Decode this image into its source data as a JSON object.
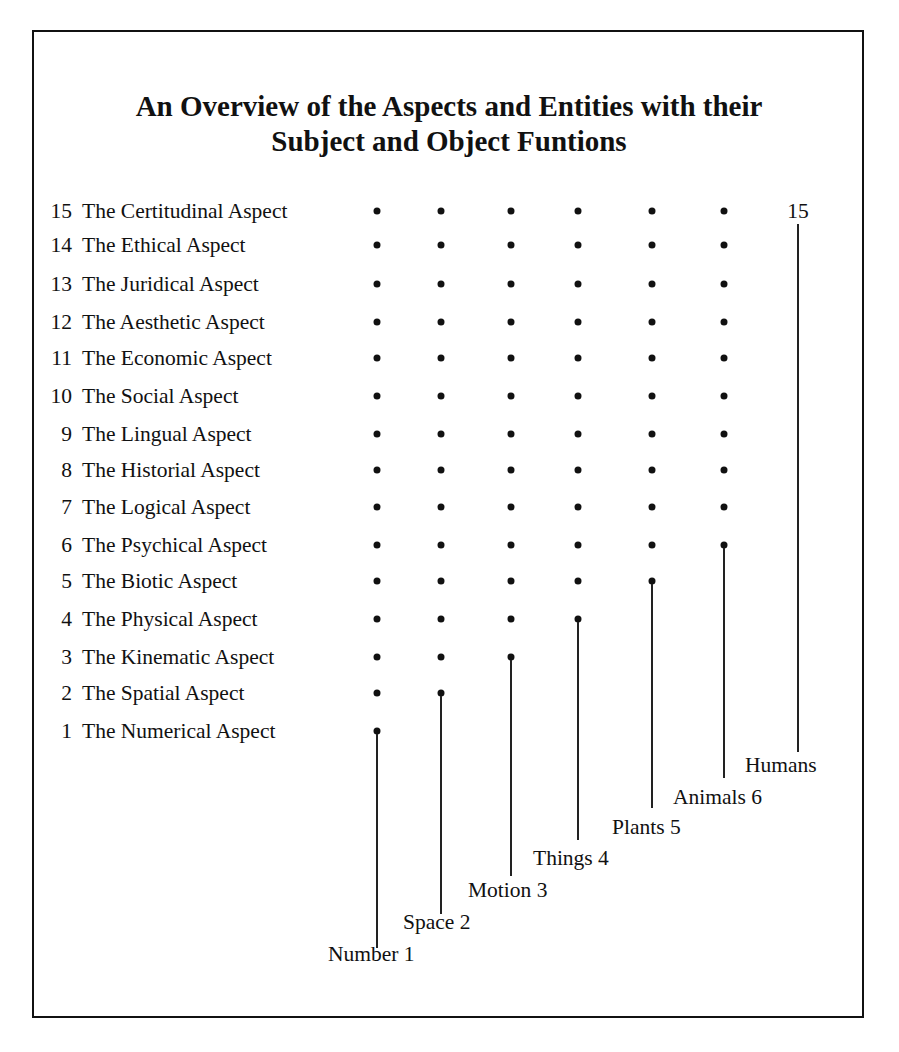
{
  "title": {
    "line1": "An Overview of the Aspects and Entities with their",
    "line2": "Subject and Object Funtions"
  },
  "aspects": [
    {
      "number": "15",
      "label": "The Certitudinal Aspect"
    },
    {
      "number": "14",
      "label": "The Ethical Aspect"
    },
    {
      "number": "13",
      "label": "The Juridical Aspect"
    },
    {
      "number": "12",
      "label": "The Aesthetic Aspect"
    },
    {
      "number": "11",
      "label": "The Economic Aspect"
    },
    {
      "number": "10",
      "label": "The Social Aspect"
    },
    {
      "number": "9",
      "label": "The Lingual Aspect"
    },
    {
      "number": "8",
      "label": "The Historial Aspect"
    },
    {
      "number": "7",
      "label": "The Logical Aspect"
    },
    {
      "number": "6",
      "label": "The Psychical Aspect"
    },
    {
      "number": "5",
      "label": "The Biotic Aspect"
    },
    {
      "number": "4",
      "label": "The Physical Aspect"
    },
    {
      "number": "3",
      "label": "The Kinematic Aspect"
    },
    {
      "number": "2",
      "label": "The Spatial Aspect"
    },
    {
      "number": "1",
      "label": "The Numerical Aspect"
    }
  ],
  "entities": [
    {
      "label": "Number 1",
      "subject_function_up_to": 1
    },
    {
      "label": "Space 2",
      "subject_function_up_to": 2
    },
    {
      "label": "Motion 3",
      "subject_function_up_to": 3
    },
    {
      "label": "Things 4",
      "subject_function_up_to": 4
    },
    {
      "label": "Plants 5",
      "subject_function_up_to": 5
    },
    {
      "label": "Animals 6",
      "subject_function_up_to": 6
    },
    {
      "label": "Humans",
      "subject_function_up_to": 15
    }
  ],
  "humans_top_label": "15"
}
